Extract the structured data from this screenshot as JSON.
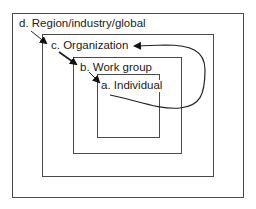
{
  "diagram": {
    "type": "nested-levels",
    "levels": [
      {
        "id": "d",
        "label": "d. Region/industry/global"
      },
      {
        "id": "c",
        "label": "c. Organization"
      },
      {
        "id": "b",
        "label": "b. Work group"
      },
      {
        "id": "a",
        "label": "a. Individual"
      }
    ],
    "arrows": [
      {
        "from": "d",
        "to": "c",
        "kind": "top-down"
      },
      {
        "from": "c",
        "to": "b",
        "kind": "top-down"
      },
      {
        "from": "b",
        "to": "a",
        "kind": "top-down"
      },
      {
        "from": "a",
        "to": "c",
        "kind": "bottom-up curved"
      }
    ],
    "colors": {
      "line": "#4a4a4a",
      "text": "#1a1a1a",
      "background": "#ffffff"
    }
  }
}
